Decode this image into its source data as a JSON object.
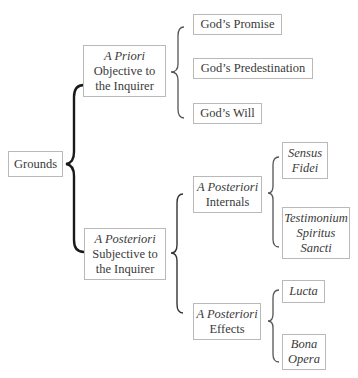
{
  "diagram": {
    "root": {
      "label": "Grounds"
    },
    "a_priori": {
      "qualifier": "A Priori",
      "line1": "Objective to",
      "line2": "the Inquirer",
      "children": [
        "God’s Promise",
        "God’s Predestination",
        "God’s Will"
      ]
    },
    "a_posteriori": {
      "qualifier": "A Posteriori",
      "line1": "Subjective to",
      "line2": "the Inquirer",
      "internals": {
        "qualifier": "A Posteriori",
        "label": "Internals",
        "children": [
          {
            "lines": [
              "Sensus",
              "Fidei"
            ]
          },
          {
            "lines": [
              "Testimonium",
              "Spiritus",
              "Sancti"
            ]
          }
        ]
      },
      "effects": {
        "qualifier": "A Posteriori",
        "label": "Effects",
        "children": [
          {
            "lines": [
              "Lucta"
            ]
          },
          {
            "lines": [
              "Bona",
              "Opera"
            ]
          }
        ]
      }
    },
    "colors": {
      "brace_dark": "#1a1a1a",
      "brace_light": "#555555",
      "box_border": "#b9b9b9",
      "text": "#3a3a3a"
    }
  }
}
